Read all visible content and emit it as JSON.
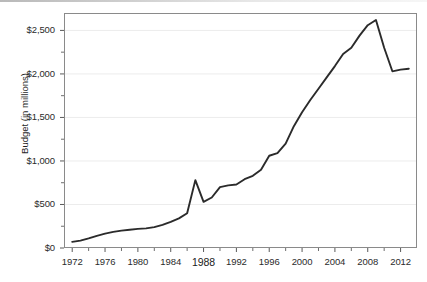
{
  "chart_data": {
    "type": "line",
    "title": "",
    "xlabel": "",
    "ylabel": "Budget (in millions)",
    "xlim": [
      1971,
      2014
    ],
    "ylim": [
      0,
      2700
    ],
    "grid": true,
    "legend": "none",
    "y_tick_labels": [
      "$0",
      "$500",
      "$1,000",
      "$1,500",
      "$2,000",
      "$2,500"
    ],
    "y_tick_values": [
      0,
      500,
      1000,
      1500,
      2000,
      2500
    ],
    "y_minor_tick_values": [
      250,
      750,
      1250,
      1750,
      2250
    ],
    "x_tick_labels": [
      "1972",
      "1976",
      "1980",
      "1984",
      "1988",
      "1992",
      "1996",
      "2000",
      "2004",
      "2008",
      "2012"
    ],
    "x_tick_values": [
      1972,
      1976,
      1980,
      1984,
      1988,
      1992,
      1996,
      2000,
      2004,
      2008,
      2012
    ],
    "x_minor_tick_values": [
      1974,
      1978,
      1982,
      1986,
      1990,
      1994,
      1998,
      2002,
      2006,
      2010
    ],
    "emphasized_x_label": "1988",
    "line_color": "#2b2b2b",
    "grid_color": "#ececec",
    "axis_color": "#8a8a8a",
    "x": [
      1972,
      1973,
      1974,
      1975,
      1976,
      1977,
      1978,
      1979,
      1980,
      1981,
      1982,
      1983,
      1984,
      1985,
      1986,
      1987,
      1988,
      1989,
      1990,
      1991,
      1992,
      1993,
      1994,
      1995,
      1996,
      1997,
      1998,
      1999,
      2000,
      2001,
      2002,
      2003,
      2004,
      2005,
      2006,
      2007,
      2008,
      2009,
      2010,
      2011,
      2012,
      2013
    ],
    "series": [
      {
        "name": "Budget",
        "values": [
          70,
          85,
          110,
          140,
          165,
          185,
          200,
          210,
          220,
          225,
          240,
          265,
          300,
          340,
          400,
          780,
          530,
          580,
          700,
          720,
          730,
          790,
          830,
          900,
          1060,
          1090,
          1200,
          1400,
          1560,
          1700,
          1830,
          1960,
          2090,
          2230,
          2300,
          2440,
          2560,
          2620,
          2300,
          2030,
          2050,
          2060
        ]
      }
    ],
    "annotations": {
      "spike_year": 1987,
      "spike_value": 780,
      "peak_year": 2009,
      "peak_value": 2620,
      "final_value": 2060
    }
  },
  "plot_geometry": {
    "left": 64,
    "right": 417,
    "top": 13,
    "bottom": 248
  }
}
